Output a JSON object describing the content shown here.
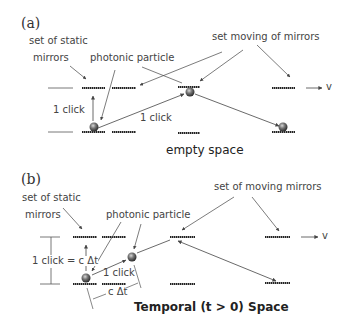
{
  "panel_a": {
    "tag": "(a)",
    "label_static_line1": "set of static",
    "label_static_line2": "mirrors",
    "label_particle": "photonic particle",
    "label_moving": "set moving of mirrors",
    "label_click_vertical": "1 click",
    "label_click_diagonal": "1 click",
    "velocity": "v",
    "caption": "empty space"
  },
  "panel_b": {
    "tag": "(b)",
    "label_static_line1": "set of static",
    "label_static_line2": "mirrors",
    "label_particle": "photonic particle",
    "label_moving": "set of moving mirrors",
    "label_click_vertical": "1 click = c Δt",
    "label_click_diagonal": "1 click",
    "label_horizontal": "c Δt",
    "velocity": "v",
    "caption": "Temporal (t > 0) Space"
  },
  "colors": {
    "mirror": "#222222",
    "arrow": "#555555",
    "text": "#444444",
    "particle": "#555555"
  }
}
